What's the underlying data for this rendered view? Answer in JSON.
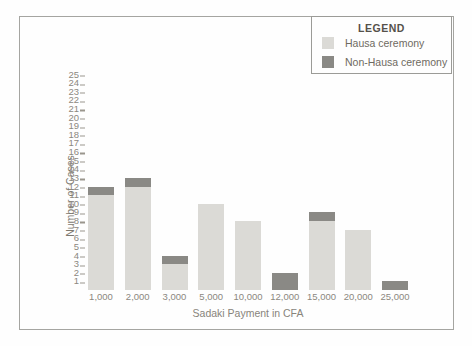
{
  "figure": {
    "background": "#fefefe",
    "frame_color": "#a5a5a1"
  },
  "legend": {
    "title": "LEGEND",
    "items": [
      {
        "label": "Hausa ceremony",
        "color": "#dbdad6"
      },
      {
        "label": "Non-Hausa ceremony",
        "color": "#8a8985"
      }
    ]
  },
  "chart_data": {
    "type": "bar",
    "stacked": true,
    "title": "",
    "xlabel": "Sadaki Payment in CFA",
    "ylabel": "Number of Cases",
    "categories": [
      "1,000",
      "2,000",
      "3,000",
      "5,000",
      "10,000",
      "12,000",
      "15,000",
      "20,000",
      "25,000"
    ],
    "series": [
      {
        "name": "Hausa ceremony",
        "color": "#dbdad6",
        "values": [
          11,
          12,
          3,
          10,
          8,
          0,
          8,
          7,
          0
        ]
      },
      {
        "name": "Non-Hausa ceremony",
        "color": "#8a8985",
        "values": [
          1,
          1,
          1,
          0,
          0,
          2,
          1,
          0,
          1
        ]
      }
    ],
    "totals": [
      12,
      13,
      4,
      10,
      8,
      2,
      9,
      7,
      1
    ],
    "ylim": [
      0,
      25
    ],
    "yticks": [
      1,
      2,
      3,
      4,
      5,
      6,
      7,
      8,
      9,
      10,
      11,
      12,
      13,
      14,
      15,
      16,
      17,
      18,
      19,
      20,
      21,
      22,
      23,
      24,
      25
    ],
    "grid": false,
    "axis_lines": false,
    "legend_position": "top-right"
  }
}
